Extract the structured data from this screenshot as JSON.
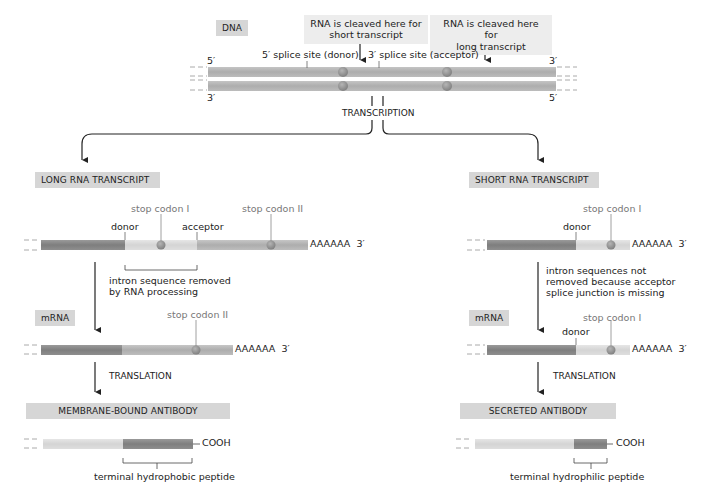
{
  "title_labels": {
    "dna": "DNA",
    "long_transcript": "LONG RNA TRANSCRIPT",
    "short_transcript": "SHORT RNA TRANSCRIPT",
    "mrna_left": "mRNA",
    "mrna_right": "mRNA",
    "membrane_antibody": "MEMBRANE-BOUND ANTIBODY",
    "secreted_antibody": "SECRETED ANTIBODY"
  },
  "dna": {
    "callout_short": [
      "RNA is cleaved here for",
      "short transcript"
    ],
    "callout_long": [
      "RNA is cleaved here for",
      "long transcript"
    ],
    "donor_site": "5′ splice site (donor)",
    "acceptor_site": "3′ splice site (acceptor)",
    "top_left_end": "5′",
    "top_right_end": "3′",
    "bottom_left_end": "3′",
    "bottom_right_end": "5′",
    "process": "TRANSCRIPTION"
  },
  "left_branch": {
    "stop_codon_1": "stop codon I",
    "stop_codon_2": "stop codon II",
    "donor": "donor",
    "acceptor": "acceptor",
    "poly_a": "AAAAAA",
    "three_prime": "3′",
    "intron_note": [
      "intron sequence removed",
      "by RNA processing"
    ],
    "mrna_stop_codon": "stop codon II",
    "mrna_poly_a": "AAAAAA",
    "mrna_three_prime": "3′",
    "translation": "TRANSLATION",
    "cooh": "COOH",
    "peptide_note": "terminal hydrophobic peptide"
  },
  "right_branch": {
    "stop_codon_1": "stop codon I",
    "donor": "donor",
    "poly_a": "AAAAAA",
    "three_prime": "3′",
    "intron_note": [
      "intron sequences not",
      "removed because acceptor",
      "splice junction is missing"
    ],
    "mrna_stop_codon": "stop codon I",
    "mrna_donor": "donor",
    "mrna_poly_a": "AAAAAA",
    "mrna_three_prime": "3′",
    "translation": "TRANSLATION",
    "cooh": "COOH",
    "peptide_note": "terminal hydrophilic peptide"
  },
  "colors": {
    "dna_strand": "#b3b3b3",
    "exon_dark": "#8a8a8a",
    "intron_light": "#dcdcdc",
    "exon_mid": "#b8b8b8",
    "codon_dot": "#9a9a9a",
    "label_box": "#d6d6d6",
    "callout_box": "#ededed"
  }
}
